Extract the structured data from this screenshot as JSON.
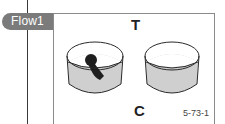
{
  "tab": {
    "label": "Flow1"
  },
  "figure": {
    "top_label": "T",
    "bottom_label": "C",
    "figure_id": "5-73-1",
    "cups": [
      {
        "name": "left-cup",
        "contents": "dark keyhole-shaped object",
        "fill_color": "#cfcfcf"
      },
      {
        "name": "right-cup",
        "contents": "empty",
        "fill_color": "#cfcfcf"
      }
    ],
    "colors": {
      "tab_bg": "#7b7b7b",
      "tab_text": "#ffffff",
      "cup_fill": "#cfcfcf",
      "object_fill": "#1e1e1e",
      "outline": "#2a2a2a"
    }
  }
}
